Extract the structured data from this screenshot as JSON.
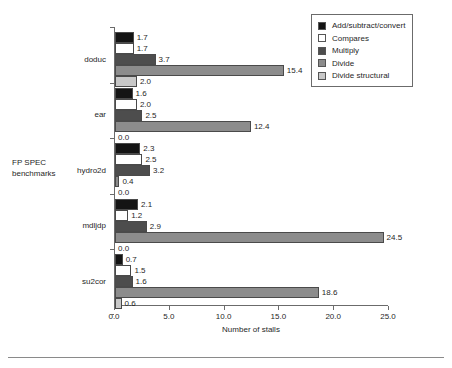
{
  "chart_data": {
    "type": "bar",
    "orientation": "horizontal",
    "title": "",
    "xlabel": "Number of stalls",
    "ylabel": "FP SPEC benchmarks",
    "xlim": [
      0.0,
      25.0
    ],
    "xticks": [
      "0.0",
      "5.0",
      "10.0",
      "15.0",
      "20.0",
      "25.0"
    ],
    "xtick_values": [
      0,
      5,
      10,
      15,
      20,
      25
    ],
    "grid": false,
    "legend_position": "top-right",
    "categories": [
      "doduc",
      "ear",
      "hydro2d",
      "mdljdp",
      "su2cor"
    ],
    "series": [
      {
        "name": "Add/subtract/convert",
        "color": "#141414",
        "values": [
          1.7,
          1.6,
          2.3,
          2.1,
          0.7
        ],
        "labels": [
          "1.7",
          "1.6",
          "2.3",
          "2.1",
          "0.7"
        ]
      },
      {
        "name": "Compares",
        "color": "#ffffff",
        "values": [
          1.7,
          2.0,
          2.5,
          1.2,
          1.5
        ],
        "labels": [
          "1.7",
          "2.0",
          "2.5",
          "1.2",
          "1.5"
        ]
      },
      {
        "name": "Multiply",
        "color": "#4d4d4d",
        "values": [
          3.7,
          2.5,
          3.2,
          2.9,
          1.6
        ],
        "labels": [
          "3.7",
          "2.5",
          "3.2",
          "2.9",
          "1.6"
        ]
      },
      {
        "name": "Divide",
        "color": "#8c8c8c",
        "values": [
          15.4,
          12.4,
          0.4,
          24.5,
          18.6
        ],
        "labels": [
          "15.4",
          "12.4",
          "0.4",
          "24.5",
          "18.6"
        ]
      },
      {
        "name": "Divide structural",
        "color": "#c8c8c8",
        "values": [
          2.0,
          0.0,
          0.0,
          0.0,
          0.6
        ],
        "labels": [
          "2.0",
          "0.0",
          "0.0",
          "0.0",
          "0.6"
        ]
      }
    ]
  },
  "legend": {
    "items": [
      {
        "label": "Add/subtract/convert",
        "color": "#141414"
      },
      {
        "label": "Compares",
        "color": "#ffffff"
      },
      {
        "label": "Multiply",
        "color": "#4d4d4d"
      },
      {
        "label": "Divide",
        "color": "#8c8c8c"
      },
      {
        "label": "Divide structural",
        "color": "#c8c8c8"
      }
    ]
  },
  "axes": {
    "x_title": "Number of stalls",
    "y_title_line1": "FP SPEC",
    "y_title_line2": "benchmarks"
  }
}
